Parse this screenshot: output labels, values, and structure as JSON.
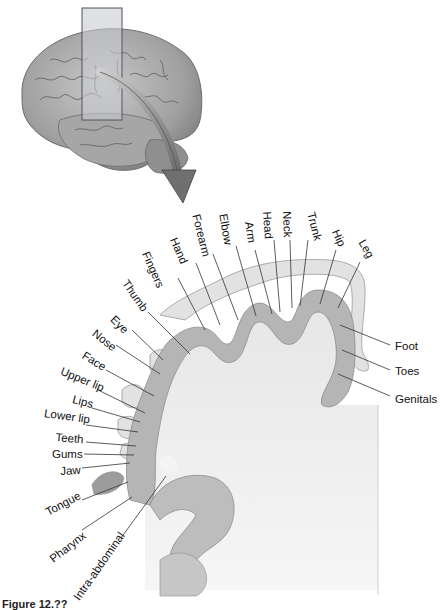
{
  "figure": {
    "caption": "Figure 12.??",
    "colors": {
      "cortex_fill": "#b8b8b8",
      "white_matter": "#ececec",
      "brain_fill": "#a9a9a9",
      "plane": "#c9ccd0",
      "arrow": "#7a7a7a",
      "leader_lines": "#333333"
    }
  },
  "labels": {
    "top": [
      {
        "text": "Fingers",
        "x": 150,
        "y": 250,
        "rot": 66
      },
      {
        "text": "Hand",
        "x": 178,
        "y": 236,
        "rot": 66
      },
      {
        "text": "Forearm",
        "x": 201,
        "y": 213,
        "rot": 76
      },
      {
        "text": "Elbow",
        "x": 228,
        "y": 213,
        "rot": 80
      },
      {
        "text": "Arm",
        "x": 254,
        "y": 221,
        "rot": 82
      },
      {
        "text": "Head",
        "x": 272,
        "y": 211,
        "rot": 86
      },
      {
        "text": "Neck",
        "x": 292,
        "y": 211,
        "rot": 88
      },
      {
        "text": "Trunk",
        "x": 316,
        "y": 211,
        "rot": 76
      },
      {
        "text": "Hip",
        "x": 340,
        "y": 228,
        "rot": 66
      },
      {
        "text": "Leg",
        "x": 360,
        "y": 240,
        "rot": 60
      },
      {
        "text": "Thumb",
        "x": 129,
        "y": 278,
        "rot": 55
      }
    ],
    "left": [
      {
        "text": "Eye",
        "x": 116,
        "y": 314,
        "rot": 45
      },
      {
        "text": "Nose",
        "x": 97,
        "y": 328,
        "rot": 38
      },
      {
        "text": "Face",
        "x": 86,
        "y": 350,
        "rot": 32
      },
      {
        "text": "Upper lip",
        "x": 63,
        "y": 366,
        "rot": 22
      },
      {
        "text": "Lips",
        "x": 74,
        "y": 394,
        "rot": 15
      },
      {
        "text": "Lower lip",
        "x": 45,
        "y": 408,
        "rot": 8
      },
      {
        "text": "Teeth",
        "x": 56,
        "y": 432,
        "rot": 5
      },
      {
        "text": "Gums",
        "x": 52,
        "y": 449,
        "rot": 0
      },
      {
        "text": "Jaw",
        "x": 60,
        "y": 466,
        "rot": -3
      },
      {
        "text": "Tongue",
        "x": 44,
        "y": 508,
        "rot": -28
      },
      {
        "text": "Pharynx",
        "x": 48,
        "y": 556,
        "rot": -38
      },
      {
        "text": "Intra-abdominal",
        "x": 72,
        "y": 596,
        "rot": -55
      }
    ],
    "right": [
      {
        "text": "Foot",
        "x": 395,
        "y": 341,
        "rot": 0
      },
      {
        "text": "Toes",
        "x": 395,
        "y": 366,
        "rot": 0
      },
      {
        "text": "Genitals",
        "x": 395,
        "y": 394,
        "rot": 0
      }
    ]
  }
}
